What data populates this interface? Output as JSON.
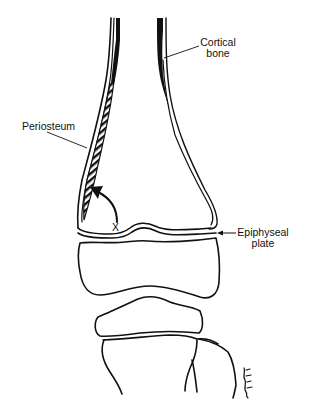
{
  "figure": {
    "colors": {
      "line": "#111111",
      "background": "#ffffff"
    },
    "labels": {
      "cortical_bone_line1": "Cortical",
      "cortical_bone_line2": "bone",
      "periosteum": "Periosteum",
      "x_marker": "X",
      "epiphyseal_plate_line1": "Epiphyseal",
      "epiphyseal_plate_line2": "plate"
    },
    "signature": "illustrator signature (handwritten)"
  }
}
